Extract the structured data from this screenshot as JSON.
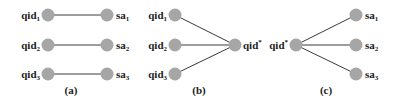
{
  "colors": {
    "node": "#a6a6a6",
    "edge": "#3a3a3a",
    "text": "#222222"
  },
  "panels": [
    {
      "caption": "(a)",
      "description": "one-to-one mapping",
      "left_nodes": [
        {
          "base": "qid",
          "sub": "1"
        },
        {
          "base": "qid",
          "sub": "2"
        },
        {
          "base": "qid",
          "sub": "3"
        }
      ],
      "right_nodes": [
        {
          "base": "sa",
          "sub": "1"
        },
        {
          "base": "sa",
          "sub": "2"
        },
        {
          "base": "sa",
          "sub": "3"
        }
      ]
    },
    {
      "caption": "(b)",
      "description": "many-to-one",
      "left_nodes": [
        {
          "base": "qid",
          "sub": "1"
        },
        {
          "base": "qid",
          "sub": "2"
        },
        {
          "base": "qid",
          "sub": "3"
        }
      ],
      "right_node": {
        "base": "qid",
        "sup": "*"
      }
    },
    {
      "caption": "(c)",
      "description": "one-to-many",
      "left_node": {
        "base": "qid",
        "sup": "*"
      },
      "right_nodes": [
        {
          "base": "sa",
          "sub": "1"
        },
        {
          "base": "sa",
          "sub": "2"
        },
        {
          "base": "sa",
          "sub": "3"
        }
      ]
    }
  ]
}
